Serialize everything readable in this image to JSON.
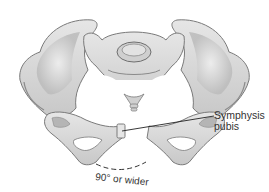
{
  "figure": {
    "colors": {
      "bone_fill": "#d9d9d9",
      "bone_light": "#ececec",
      "bone_shadow": "#9a9a9a",
      "bone_outline": "#6f6f6f",
      "leader_line": "#222222",
      "text": "#333333"
    }
  },
  "labels": {
    "symphysis_line1": "Symphysis",
    "symphysis_line2": "pubis",
    "angle": "90° or wider"
  }
}
